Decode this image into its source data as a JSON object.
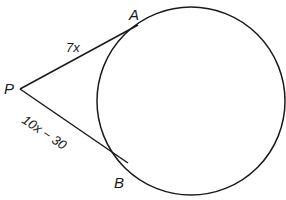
{
  "diagram": {
    "type": "geometry-tangent-segments",
    "circle": {
      "cx": 191,
      "cy": 101,
      "r": 94,
      "stroke": "#1a1a1a"
    },
    "points": {
      "P": {
        "label": "P",
        "x": 20,
        "y": 89
      },
      "A": {
        "label": "A",
        "x": 138,
        "y": 25
      },
      "B": {
        "label": "B",
        "x": 128,
        "y": 163
      }
    },
    "segments": [
      {
        "id": "PA",
        "label": "7x"
      },
      {
        "id": "PB",
        "label": "10x − 30"
      }
    ]
  }
}
